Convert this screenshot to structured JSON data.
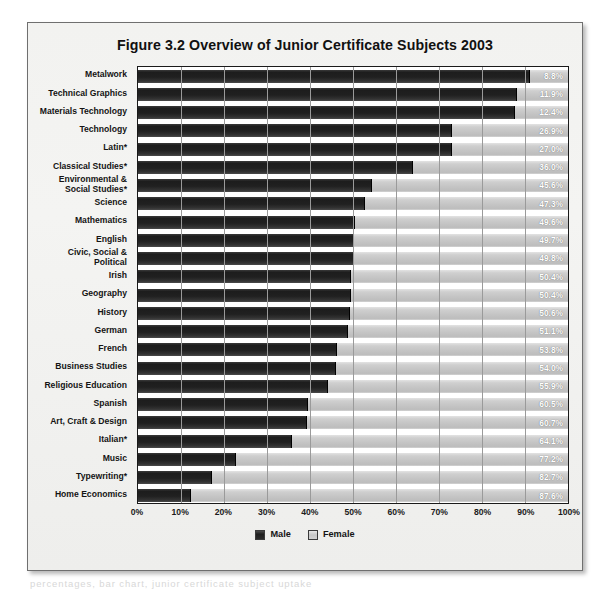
{
  "figure": {
    "title": "Figure 3.2   Overview of Junior Certificate Subjects 2003",
    "footer_text": "percentages, bar chart, junior certificate subject uptake"
  },
  "legend": {
    "position": "bottom-center",
    "items": [
      {
        "label": "Male",
        "color": "#202020",
        "swatch": "male"
      },
      {
        "label": "Female",
        "color": "#c4c4c4",
        "swatch": "female"
      }
    ]
  },
  "axis": {
    "ticks": [
      "0%",
      "10%",
      "20%",
      "30%",
      "40%",
      "50%",
      "60%",
      "70%",
      "80%",
      "90%",
      "100%"
    ],
    "min": 0,
    "max": 100
  },
  "chart_data": {
    "type": "bar",
    "orientation": "horizontal",
    "stacked": true,
    "normalized_to": 100,
    "title": "Figure 3.2   Overview of Junior Certificate Subjects 2003",
    "xlabel": "",
    "ylabel": "",
    "xlim": [
      0,
      100
    ],
    "grid": true,
    "tick_labels": [
      "0%",
      "10%",
      "20%",
      "30%",
      "40%",
      "50%",
      "60%",
      "70%",
      "80%",
      "90%",
      "100%"
    ],
    "legend": [
      "Male",
      "Female"
    ],
    "value_label_series": "Female",
    "categories": [
      "Metalwork",
      "Technical Graphics",
      "Materials Technology",
      "Technology",
      "Latin*",
      "Classical Studies*",
      "Environmental &\nSocial Studies*",
      "Science",
      "Mathematics",
      "English",
      "Civic, Social &\nPolitical",
      "Irish",
      "Geography",
      "History",
      "German",
      "French",
      "Business Studies",
      "Religious Education",
      "Spanish",
      "Art, Craft & Design",
      "Italian*",
      "Music",
      "Typewriting*",
      "Home Economics"
    ],
    "series": [
      {
        "name": "Male",
        "color": "#202020",
        "values": [
          91.2,
          88.1,
          87.6,
          73.1,
          73.0,
          64.0,
          54.4,
          52.7,
          50.4,
          50.3,
          50.2,
          49.6,
          49.6,
          49.4,
          48.9,
          46.2,
          46.0,
          44.1,
          39.5,
          39.3,
          35.9,
          22.8,
          17.3,
          12.4
        ]
      },
      {
        "name": "Female",
        "color": "#c4c4c4",
        "values": [
          8.8,
          11.9,
          12.4,
          26.9,
          27.0,
          36.0,
          45.6,
          47.3,
          49.6,
          49.7,
          49.8,
          50.4,
          50.4,
          50.6,
          51.1,
          53.8,
          54.0,
          55.9,
          60.5,
          60.7,
          64.1,
          77.2,
          82.7,
          87.6
        ]
      }
    ],
    "data_labels": [
      "8.8%",
      "11.9%",
      "12.4%",
      "26.9%",
      "27.0%",
      "36.0%",
      "45.6%",
      "47.3%",
      "49.6%",
      "49.7%",
      "49.8%",
      "50.4%",
      "50.4%",
      "50.6%",
      "51.1%",
      "53.8%",
      "54.0%",
      "55.9%",
      "60.5%",
      "60.7%",
      "64.1%",
      "77.2%",
      "82.7%",
      "87.6%"
    ]
  }
}
